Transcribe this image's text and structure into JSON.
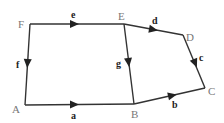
{
  "diagram": {
    "type": "directed-graph",
    "vertices": [
      {
        "id": "A",
        "label": "A",
        "x": 25,
        "y": 105,
        "lx": 14,
        "ly": 113
      },
      {
        "id": "B",
        "label": "B",
        "x": 134,
        "y": 104,
        "lx": 132,
        "ly": 118
      },
      {
        "id": "C",
        "label": "C",
        "x": 205,
        "y": 88,
        "lx": 208,
        "ly": 95
      },
      {
        "id": "D",
        "label": "D",
        "x": 183,
        "y": 35,
        "lx": 187,
        "ly": 41
      },
      {
        "id": "E",
        "label": "E",
        "x": 124,
        "y": 24,
        "lx": 119,
        "ly": 20
      },
      {
        "id": "F",
        "label": "F",
        "x": 30,
        "y": 24,
        "lx": 18,
        "ly": 28
      }
    ],
    "edges": [
      {
        "id": "a",
        "label": "a",
        "from": "A",
        "to": "B",
        "lx": 72,
        "ly": 119
      },
      {
        "id": "b",
        "label": "b",
        "from": "B",
        "to": "C",
        "lx": 173,
        "ly": 108
      },
      {
        "id": "c",
        "label": "c",
        "from": "D",
        "to": "C",
        "lx": 199,
        "ly": 61
      },
      {
        "id": "d",
        "label": "d",
        "from": "E",
        "to": "D",
        "lx": 153,
        "ly": 24
      },
      {
        "id": "e",
        "label": "e",
        "from": "F",
        "to": "E",
        "lx": 71,
        "ly": 18
      },
      {
        "id": "f",
        "label": "f",
        "from": "F",
        "to": "A",
        "lx": 17,
        "ly": 68
      },
      {
        "id": "g",
        "label": "g",
        "from": "E",
        "to": "B",
        "lx": 117,
        "ly": 67
      }
    ]
  },
  "labels": {
    "A": "A",
    "B": "B",
    "C": "C",
    "D": "D",
    "E": "E",
    "F": "F",
    "a": "a",
    "b": "b",
    "c": "c",
    "d": "d",
    "e": "e",
    "f": "f",
    "g": "g"
  }
}
